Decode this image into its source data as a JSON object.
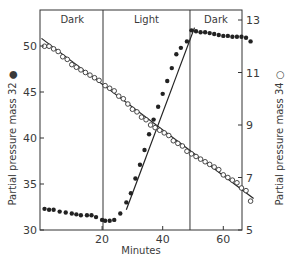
{
  "chart_data": {
    "type": "scatter",
    "title": "",
    "xlabel": "Minutes",
    "ylabel_left": "Partial pressure mass 32 ●",
    "ylabel_right": "Partial pressure mass 34 ○",
    "xlim": [
      0,
      72
    ],
    "ylim_left": [
      30,
      53
    ],
    "ylim_right": [
      5,
      13.3
    ],
    "x_ticks": [
      20,
      40,
      60
    ],
    "y_left_ticks": [
      30,
      35,
      40,
      45,
      50
    ],
    "y_right_ticks": [
      5,
      7,
      9,
      11,
      13
    ],
    "grid": false,
    "phases": [
      {
        "label": "Dark",
        "start": 0,
        "end": 20.3
      },
      {
        "label": "Light",
        "start": 20.3,
        "end": 49
      },
      {
        "label": "Dark",
        "start": 49,
        "end": 72
      }
    ],
    "series": [
      {
        "name": "mass 32 (filled circles)",
        "axis": "left",
        "marker": "filled-circle",
        "x": [
          1,
          2.5,
          4,
          6,
          8,
          10,
          11.5,
          13,
          15,
          16.5,
          18,
          20,
          21,
          22.5,
          24,
          26,
          28,
          29.5,
          31,
          32.5,
          34,
          35.5,
          37,
          38.5,
          40,
          41.5,
          43,
          44.5,
          46,
          48,
          49.5,
          51,
          52.5,
          54,
          55.5,
          57,
          58.5,
          60,
          61.5,
          63,
          64.5,
          66,
          67.5,
          69
        ],
        "y": [
          32.3,
          32.2,
          32.2,
          32.0,
          31.9,
          31.8,
          31.7,
          31.6,
          31.6,
          31.6,
          31.4,
          31.1,
          31.0,
          31.0,
          31.1,
          31.8,
          33.0,
          34.0,
          35.6,
          37.1,
          38.7,
          40.4,
          42.0,
          43.4,
          44.8,
          46.2,
          47.6,
          49.1,
          49.8,
          50.5,
          51.7,
          51.6,
          51.5,
          51.5,
          51.4,
          51.3,
          51.2,
          51.1,
          51.1,
          51.0,
          51.0,
          51.0,
          50.9,
          50.5
        ]
      },
      {
        "name": "mass 34 (open circles)",
        "axis": "right",
        "marker": "open-circle",
        "x": [
          1,
          2.5,
          4,
          5.5,
          7,
          8.5,
          10,
          11.5,
          13,
          14.5,
          16,
          17.5,
          19,
          21,
          22.5,
          24,
          25.5,
          27,
          28.5,
          30,
          31.5,
          33,
          34.5,
          36,
          37.5,
          39,
          40.5,
          42,
          43.5,
          45,
          46.5,
          48,
          49.5,
          51,
          52.5,
          54,
          55.5,
          57,
          58.5,
          60,
          61.5,
          63,
          64.5,
          66,
          67.5,
          69
        ],
        "y": [
          12.0,
          12.0,
          11.9,
          11.8,
          11.6,
          11.5,
          11.3,
          11.2,
          11.1,
          11.0,
          10.9,
          10.8,
          10.7,
          10.5,
          10.4,
          10.3,
          10.1,
          10.0,
          9.8,
          9.6,
          9.5,
          9.3,
          9.2,
          9.0,
          8.9,
          8.8,
          8.7,
          8.6,
          8.4,
          8.3,
          8.2,
          8.0,
          7.9,
          7.8,
          7.7,
          7.6,
          7.5,
          7.4,
          7.3,
          7.1,
          7.0,
          6.9,
          6.8,
          6.6,
          6.5,
          6.1
        ]
      }
    ],
    "fit_lines": [
      {
        "series": "mass 34",
        "axis": "right",
        "from": [
          0,
          12.3
        ],
        "to": [
          70,
          6.2
        ]
      },
      {
        "series": "mass 32 rise",
        "axis": "left",
        "from": [
          28,
          32.2
        ],
        "to": [
          50.5,
          52.0
        ]
      }
    ]
  }
}
